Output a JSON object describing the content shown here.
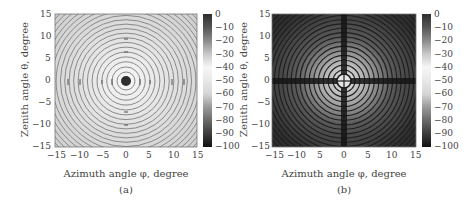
{
  "chart_data": [
    {
      "type": "heatmap",
      "panel_label": "(a)",
      "title": "",
      "xlabel": "Azimuth angle φ, degree",
      "ylabel": "Zenith angle θ, degree",
      "xlim": [
        -15,
        15
      ],
      "ylim": [
        -15,
        15
      ],
      "xticks": [
        "-15",
        "-10",
        "-5",
        "0",
        "5",
        "10",
        "15"
      ],
      "yticks": [
        "15",
        "10",
        "5",
        "0",
        "-5",
        "-10",
        "-15"
      ],
      "colorbar": {
        "range": [
          -100,
          0
        ],
        "ticks": [
          "0",
          "-10",
          "-20",
          "-30",
          "-40",
          "-50",
          "-60",
          "-70",
          "-80",
          "-90",
          "-100"
        ],
        "colormap": "gray (banded)"
      },
      "description": "Concentric ring pattern on light background with dark central spot at (0,0); faint dark marks along horizontal and vertical axes"
    },
    {
      "type": "heatmap",
      "panel_label": "(b)",
      "title": "",
      "xlabel": "Azimuth angle φ, degree",
      "ylabel": "Zenith angle θ, degree",
      "xlim": [
        -15,
        15
      ],
      "ylim": [
        -15,
        15
      ],
      "xticks": [
        "-15",
        "-10",
        "5",
        "0",
        "5",
        "10",
        "15"
      ],
      "yticks": [
        "15",
        "10",
        "5",
        "0",
        "-5",
        "-10",
        "-15"
      ],
      "colorbar": {
        "range": [
          -100,
          0
        ],
        "ticks": [
          "0",
          "-10",
          "-20",
          "-30",
          "-40",
          "-50",
          "-60",
          "-70",
          "-80",
          "-90",
          "-100"
        ],
        "colormap": "gray (banded)"
      },
      "description": "Concentric rings on dark background, brighter near center, with dark cross along phi=0 and theta=0 axes and dark ring of radius ~1.5 deg around origin"
    }
  ],
  "panels": {
    "a": {
      "label": "(a)",
      "xlabel": "Azimuth angle φ, degree",
      "ylabel": "Zenith angle θ, degree",
      "xticks": [
        "−15",
        "−10",
        "−5",
        "0",
        "5",
        "10",
        "15"
      ],
      "yticks": [
        "15",
        "10",
        "5",
        "0",
        "−5",
        "−10",
        "−15"
      ],
      "cbticks": [
        "0",
        "−10",
        "−20",
        "−30",
        "−40",
        "−50",
        "−60",
        "−70",
        "−80",
        "−90",
        "−100"
      ]
    },
    "b": {
      "label": "(b)",
      "xlabel": "Azimuth angle φ, degree",
      "ylabel": "Zenith angle θ, degree",
      "xticks": [
        "−15",
        "−10",
        "5",
        "0",
        "5",
        "10",
        "15"
      ],
      "yticks": [
        "15",
        "10",
        "5",
        "0",
        "−5",
        "−10",
        "−15"
      ],
      "cbticks": [
        "0",
        "−10",
        "−20",
        "−30",
        "−40",
        "−50",
        "−60",
        "−70",
        "−80",
        "−90",
        "−100"
      ]
    }
  },
  "colors": {
    "colorbar_stops": [
      "#2e2e2e",
      "#555555",
      "#8a8a8a",
      "#c8c8c8",
      "#f4f4f4",
      "#e6e6e6",
      "#d2d2d2",
      "#9a9a9a",
      "#6a6a6a",
      "#3c3c3c",
      "#111111"
    ]
  }
}
